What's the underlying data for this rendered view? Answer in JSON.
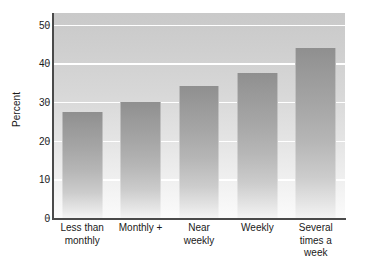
{
  "chart_data": {
    "type": "bar",
    "title": "",
    "subtitle": "",
    "xlabel": "",
    "ylabel": "Percent",
    "categories": [
      "Less than\nmonthly",
      "Monthly +",
      "Near\nweekly",
      "Weekly",
      "Several\ntimes a\nweek"
    ],
    "values": [
      27.5,
      30.0,
      34.2,
      37.4,
      44.0
    ],
    "ylim": [
      0,
      53
    ],
    "yticks": [
      0,
      10,
      20,
      30,
      40,
      50
    ],
    "ytick_labels": [
      "0",
      "10",
      "20",
      "30",
      "40",
      "50"
    ],
    "grid": true,
    "grid_axis": "y",
    "legend": false,
    "legend_position": "none",
    "bar_color": "#a8a8a8",
    "grid_color": "#ffffff",
    "plot_background": "#d6d6d6",
    "axis_color": "#4a4a4a",
    "text_color": "#1a1a1a"
  }
}
